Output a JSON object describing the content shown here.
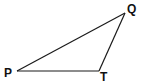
{
  "diagram": {
    "type": "triangle",
    "stroke_color": "#1a1a1a",
    "vertices": [
      {
        "id": "P",
        "label": "P",
        "x": 17,
        "y": 71
      },
      {
        "id": "T",
        "label": "T",
        "x": 99,
        "y": 71
      },
      {
        "id": "Q",
        "label": "Q",
        "x": 125,
        "y": 13
      }
    ],
    "edges": [
      [
        "P",
        "T"
      ],
      [
        "T",
        "Q"
      ],
      [
        "Q",
        "P"
      ]
    ],
    "labels": {
      "P": "P",
      "T": "T",
      "Q": "Q"
    }
  }
}
